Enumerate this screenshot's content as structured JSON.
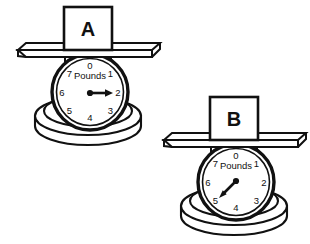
{
  "figure": {
    "unit_label": "Pounds",
    "dial_ticks": [
      "0",
      "1",
      "2",
      "3",
      "4",
      "5",
      "6",
      "7"
    ],
    "line_color": "#111111",
    "fill_color": "#ffffff",
    "background": "#ffffff"
  },
  "scales": [
    {
      "id": "scale-a",
      "box_label": "A",
      "unit_label": "Pounds",
      "reading": "2",
      "needle_angle_deg": 90,
      "ticks": [
        "0",
        "1",
        "2",
        "3",
        "4",
        "5",
        "6",
        "7"
      ]
    },
    {
      "id": "scale-b",
      "box_label": "B",
      "unit_label": "Pounds",
      "reading": "5",
      "needle_angle_deg": 225,
      "ticks": [
        "0",
        "1",
        "2",
        "3",
        "4",
        "5",
        "6",
        "7"
      ]
    }
  ]
}
